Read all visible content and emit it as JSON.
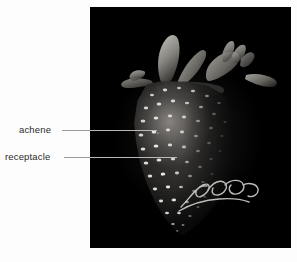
{
  "figure": {
    "type": "labeled-photograph",
    "background_color": "#fdfdfd",
    "plate_color": "#000000"
  },
  "callouts": [
    {
      "id": "achene",
      "label": "achene",
      "leader": {
        "from_x": 62,
        "to_x": 157,
        "y": 130
      }
    },
    {
      "id": "receptacle",
      "label": "receptacle",
      "leader": {
        "from_x": 64,
        "to_x": 177,
        "y": 157
      }
    }
  ],
  "photo": {
    "parts": {
      "berry_name": "receptacle",
      "seed_name": "achene",
      "calyx_name": "calyx"
    },
    "annotation_mark": "handwritten-scribble"
  }
}
